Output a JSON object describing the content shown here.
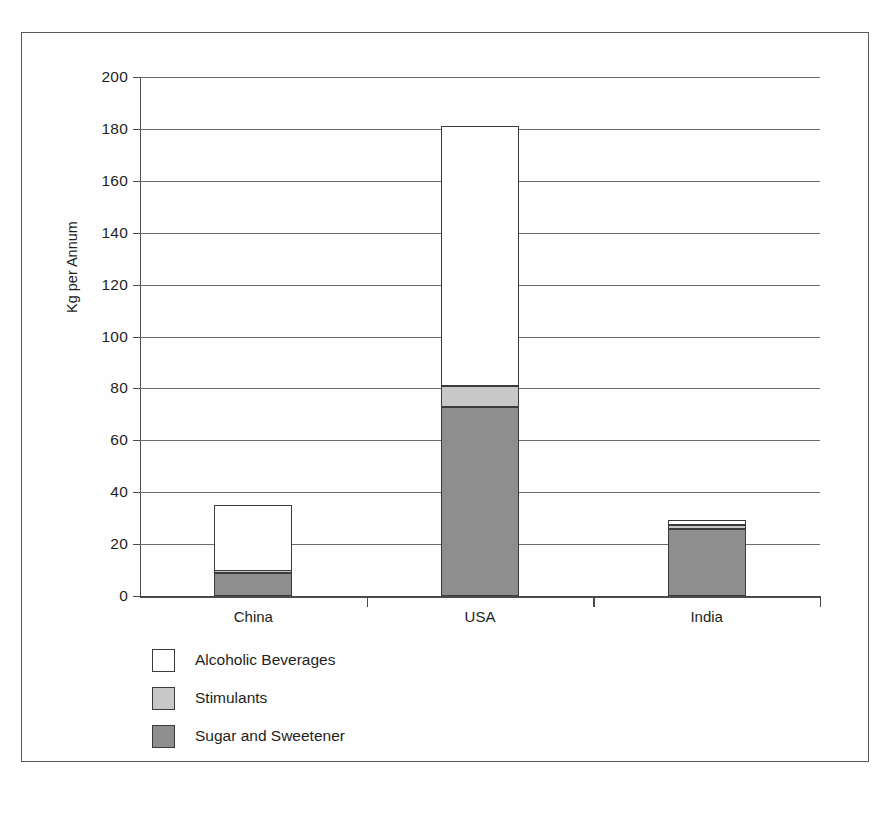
{
  "chart_data": {
    "type": "bar",
    "subtype": "stacked-bar",
    "title": "",
    "xlabel": "",
    "ylabel": "Kg per Annum",
    "categories": [
      "China",
      "USA",
      "India"
    ],
    "series": [
      {
        "name": "Sugar and Sweetener",
        "color": "#8e8e8e",
        "values": [
          9,
          73,
          26
        ]
      },
      {
        "name": "Stimulants",
        "color": "#c8c8c8",
        "values": [
          0.5,
          8,
          1.5
        ]
      },
      {
        "name": "Alcoholic Beverages",
        "color": "#ffffff",
        "values": [
          25.5,
          100,
          1.8
        ]
      }
    ],
    "totals": [
      35,
      181,
      29
    ],
    "ylim": [
      0,
      200
    ],
    "ytick_step": 20,
    "yticks": [
      0,
      20,
      40,
      60,
      80,
      100,
      120,
      140,
      160,
      180,
      200
    ],
    "ytick_labels": [
      "0",
      "20",
      "40",
      "60",
      "80",
      "100",
      "120",
      "140",
      "160",
      "180",
      "200"
    ],
    "grid": "horizontal",
    "legend_position": "below-left",
    "stack_order_bottom_to_top": [
      "Sugar and Sweetener",
      "Stimulants",
      "Alcoholic Beverages"
    ]
  },
  "legend": {
    "items": [
      {
        "label": "Alcoholic Beverages",
        "swatch": "alcohol"
      },
      {
        "label": "Stimulants",
        "swatch": "stimulant"
      },
      {
        "label": "Sugar and Sweetener",
        "swatch": "sugar"
      }
    ]
  },
  "colors": {
    "alcoholic": "#ffffff",
    "stimulants": "#c8c8c8",
    "sugar": "#8e8e8e",
    "axis": "#4a4a4c",
    "grid": "#6d6d70",
    "frame": "#58585a"
  }
}
